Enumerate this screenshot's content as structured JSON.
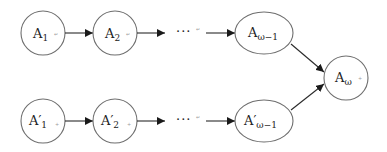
{
  "diagram": {
    "type": "sequence-merge-graph",
    "rows": [
      {
        "name": "top",
        "nodes": [
          {
            "id": "A1",
            "base": "A",
            "prime": "",
            "sub": "1",
            "mark": "↵"
          },
          {
            "id": "A2",
            "base": "A",
            "prime": "",
            "sub": "2",
            "mark": "↵"
          },
          {
            "id": "dots_top",
            "text": "···",
            "mark": "↵"
          },
          {
            "id": "Aw-1",
            "base": "A",
            "prime": "",
            "sub": "ω−1",
            "mark": ""
          }
        ]
      },
      {
        "name": "bottom",
        "nodes": [
          {
            "id": "A'1",
            "base": "A",
            "prime": "′",
            "sub": "1",
            "mark": "+"
          },
          {
            "id": "A'2",
            "base": "A",
            "prime": "′",
            "sub": "2",
            "mark": "+"
          },
          {
            "id": "dots_bottom",
            "text": "···",
            "mark": "↵"
          },
          {
            "id": "A'w-1",
            "base": "A",
            "prime": "′",
            "sub": "ω−1",
            "mark": ""
          }
        ]
      }
    ],
    "merge_node": {
      "id": "Aw+",
      "base": "A",
      "sub": "ω",
      "mark": "+"
    },
    "edges": [
      [
        "A1",
        "A2"
      ],
      [
        "A2",
        "dots_top"
      ],
      [
        "dots_top",
        "Aw-1"
      ],
      [
        "A'1",
        "A'2"
      ],
      [
        "A'2",
        "dots_bottom"
      ],
      [
        "dots_bottom",
        "A'w-1"
      ],
      [
        "Aw-1",
        "Aw+"
      ],
      [
        "A'w-1",
        "Aw+"
      ]
    ],
    "colors": {
      "node_stroke": "#6e6e6e",
      "edge": "#2a2a2a",
      "text": "#222222"
    }
  }
}
